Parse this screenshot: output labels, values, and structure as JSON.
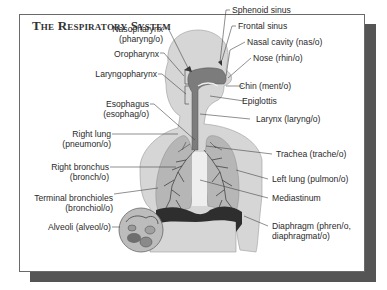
{
  "title": "The Respiratory System",
  "labels_left": [
    {
      "id": "nasopharynx",
      "line1": "Nasopharynx",
      "line2": "(pharyng/o)"
    },
    {
      "id": "oropharynx",
      "line1": "Oropharynx"
    },
    {
      "id": "laryngopharynx",
      "line1": "Laryngopharynx"
    },
    {
      "id": "esophagus",
      "line1": "Esophagus",
      "line2": "(esophag/o)"
    },
    {
      "id": "right-lung",
      "line1": "Right lung",
      "line2": "(pneumon/o)"
    },
    {
      "id": "right-bronchus",
      "line1": "Right bronchus",
      "line2": "(bronch/o)"
    },
    {
      "id": "terminal-bronchioles",
      "line1": "Terminal bronchioles",
      "line2": "(bronchiol/o)"
    },
    {
      "id": "alveoli",
      "line1": "Alveoli (alveol/o)"
    }
  ],
  "labels_right": [
    {
      "id": "sphenoid-sinus",
      "line1": "Sphenoid sinus"
    },
    {
      "id": "frontal-sinus",
      "line1": "Frontal sinus"
    },
    {
      "id": "nasal-cavity",
      "line1": "Nasal cavity (nas/o)"
    },
    {
      "id": "nose",
      "line1": "Nose (rhin/o)"
    },
    {
      "id": "chin",
      "line1": "Chin (ment/o)"
    },
    {
      "id": "epiglottis",
      "line1": "Epiglottis"
    },
    {
      "id": "larynx",
      "line1": "Larynx (laryng/o)"
    },
    {
      "id": "trachea",
      "line1": "Trachea (trache/o)"
    },
    {
      "id": "left-lung",
      "line1": "Left lung (pulmon/o)"
    },
    {
      "id": "mediastinum",
      "line1": "Mediastinum"
    },
    {
      "id": "diaphragm",
      "line1": "Diaphragm (phren/o,",
      "line2": "diaphragmat/o)"
    }
  ],
  "colors": {
    "body_fill": "#d4d4d4",
    "lung_fill": "#b4b4b4",
    "airway_fill": "#7a7a7a",
    "diaphragm_fill": "#2e2e2e",
    "frame_shadow": "#555555",
    "text": "#2a2a2a"
  }
}
